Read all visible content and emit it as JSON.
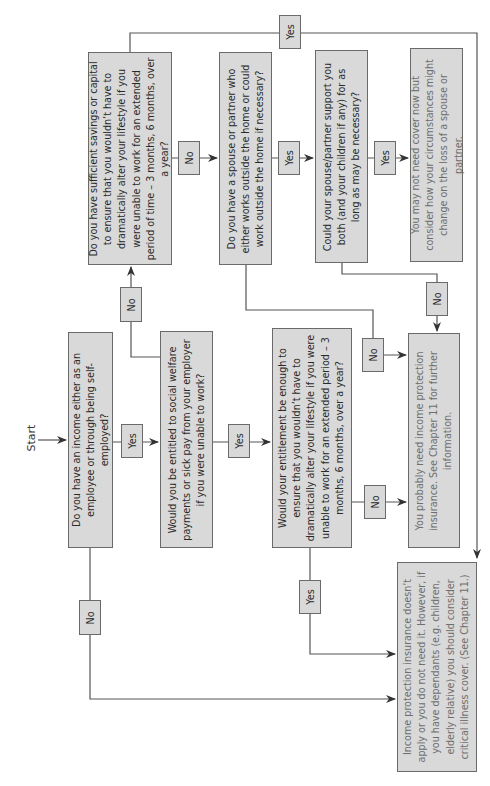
{
  "start_label": "Start",
  "questions": {
    "income": "Do you have an income either as an employee or through being self-employed?",
    "social_welfare": "Would you be entitled to social welfare payments or sick pay from your employer if you were unable to work?",
    "savings": "Do you have sufficient savings or capital to ensure that you wouldn’t have to dramatically alter your lifestyle if you were unable to work for an extended period of time – 3 months, 6 months, over a year?",
    "spouse_works": "Do you have a spouse or partner who either works outside the home or could work outside the home if necessary?",
    "spouse_support": "Could your spouse/partner support you both (and your children if any) for as long as may be necessary?",
    "entitlement": "Would your entitlement be enough to ensure that you wouldn’t have to dramatically alter your lifestyle if you were unable to work for an extended period – 3 months, 6 months, over a year?"
  },
  "outcomes": {
    "may_not_need": "You may not need cover now but consider how your circumstances might change on the loss of a spouse or partner.",
    "probably_need": "You probably need income protection insurance. See Chapter 11 for further information.",
    "does_not_apply": "Income protection insurance doesn’t apply or you do not need it. However, if you have dependants (e.g. children, elderly relative) you should consider critical illness cover. (See Chapter 11.)"
  },
  "edges": {
    "income_yes": "Yes",
    "income_no": "No",
    "welfare_yes": "Yes",
    "welfare_no": "No",
    "savings_yes": "Yes",
    "savings_no": "No",
    "spouse_works_yes": "Yes",
    "spouse_works_no": "No",
    "spouse_support_yes": "Yes",
    "spouse_support_no": "No",
    "entitlement_yes": "Yes",
    "entitlement_no": "No"
  },
  "colors": {
    "box_fill": "#d9d9d9",
    "box_border": "#6a6a6a",
    "question_text": "#2a2a2a",
    "outcome_text": "#6e6e6e",
    "line": "#555555"
  }
}
